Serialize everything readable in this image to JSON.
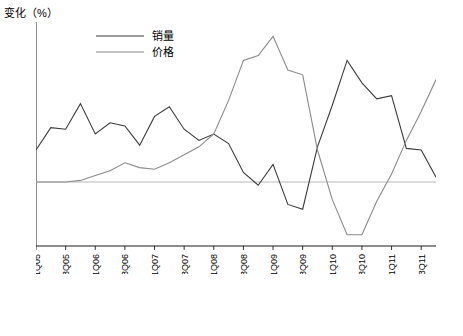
{
  "chart_data": {
    "type": "line",
    "title": "",
    "ylabel": "变化（%）",
    "xlabel": "",
    "ylim": [
      -4,
      10
    ],
    "yticks": [
      -4,
      -2,
      0,
      2,
      4,
      6,
      8,
      10
    ],
    "grid": false,
    "legend_position": "top-left",
    "categories": [
      "1Q05",
      "2Q05",
      "3Q05",
      "4Q05",
      "1Q06",
      "2Q06",
      "3Q06",
      "4Q06",
      "1Q07",
      "2Q07",
      "3Q07",
      "4Q07",
      "1Q08",
      "2Q08",
      "3Q08",
      "4Q08",
      "1Q09",
      "2Q09",
      "3Q09",
      "4Q09",
      "1Q10",
      "2Q10",
      "3Q10",
      "4Q10",
      "1Q11",
      "2Q11",
      "3Q11",
      "4Q11"
    ],
    "xtick_labels": [
      "1Q05",
      "3Q05",
      "1Q06",
      "3Q06",
      "1Q07",
      "3Q07",
      "1Q08",
      "3Q08",
      "1Q09",
      "3Q09",
      "1Q10",
      "3Q10",
      "1Q11",
      "3Q11"
    ],
    "series": [
      {
        "name": "销量",
        "color": "#3a3a3a",
        "values": [
          2.0,
          3.4,
          3.3,
          4.9,
          3.0,
          3.7,
          3.5,
          2.3,
          4.1,
          4.7,
          3.3,
          2.6,
          3.0,
          2.4,
          0.6,
          -0.2,
          1.1,
          -1.4,
          -1.7,
          2.2,
          4.8,
          7.6,
          6.2,
          5.2,
          5.4,
          2.1,
          2.0,
          0.3
        ]
      },
      {
        "name": "价格",
        "color": "#8a8a8a",
        "values": [
          0.0,
          0.0,
          0.0,
          0.1,
          0.4,
          0.7,
          1.2,
          0.9,
          0.8,
          1.2,
          1.7,
          2.2,
          3.0,
          5.1,
          7.6,
          7.9,
          9.1,
          7.0,
          6.7,
          2.0,
          -1.1,
          -3.3,
          -3.3,
          -1.2,
          0.5,
          2.6,
          4.4,
          6.4
        ]
      }
    ]
  },
  "legend": {
    "items": [
      {
        "label": "销量",
        "color": "#3a3a3a"
      },
      {
        "label": "价格",
        "color": "#8a8a8a"
      }
    ]
  }
}
